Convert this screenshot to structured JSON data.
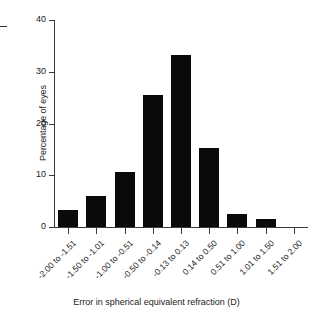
{
  "chart_data": {
    "type": "bar",
    "title": "",
    "xlabel": "Error in spherical equivalent refraction (D)",
    "ylabel": "Percentage of eyes",
    "categories": [
      "-2.00 to -1.51",
      "-1.50 to -1.01",
      "-1.00 to -0.51",
      "-0.50 to -0.14",
      "-0.13 to 0.13",
      "0.14 to 0.50",
      "0.51 to 1.00",
      "1.01 to 1.50",
      "1.51 to 2.00"
    ],
    "values": [
      3.3,
      6.0,
      10.7,
      25.6,
      33.2,
      15.3,
      2.6,
      1.5,
      0
    ],
    "ylim": [
      0,
      40
    ],
    "yticks": [
      0,
      10,
      20,
      30,
      40
    ],
    "ytick_labels": [
      "0",
      "10",
      "20",
      "30",
      "40"
    ],
    "grid": false,
    "legend": false,
    "bar_color": "#0a0a0a",
    "axis_color": "#3a3a3a"
  }
}
